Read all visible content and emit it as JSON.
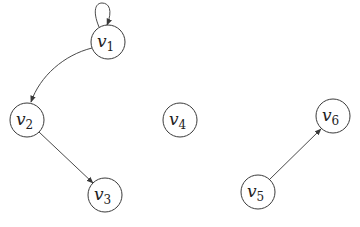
{
  "diagram": {
    "type": "directed-graph",
    "nodes": [
      {
        "id": "v1",
        "base": "v",
        "sub": "1",
        "cx": 108,
        "cy": 42
      },
      {
        "id": "v2",
        "base": "v",
        "sub": "2",
        "cx": 27,
        "cy": 120
      },
      {
        "id": "v3",
        "base": "v",
        "sub": "3",
        "cx": 105,
        "cy": 195
      },
      {
        "id": "v4",
        "base": "v",
        "sub": "4",
        "cx": 180,
        "cy": 120
      },
      {
        "id": "v5",
        "base": "v",
        "sub": "5",
        "cx": 258,
        "cy": 192
      },
      {
        "id": "v6",
        "base": "v",
        "sub": "6",
        "cx": 333,
        "cy": 116
      }
    ],
    "edges": [
      {
        "from": "v1",
        "to": "v1",
        "kind": "self-loop"
      },
      {
        "from": "v1",
        "to": "v2",
        "kind": "curved"
      },
      {
        "from": "v2",
        "to": "v3",
        "kind": "straight"
      },
      {
        "from": "v5",
        "to": "v6",
        "kind": "straight"
      }
    ],
    "node_radius": 17,
    "colors": {
      "stroke": "#3a3a3a",
      "edge": "#4a4a4a",
      "background": "#ffffff"
    }
  }
}
